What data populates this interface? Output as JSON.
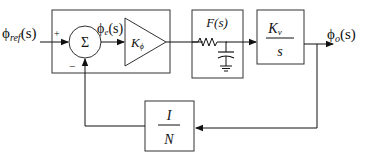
{
  "diagram": {
    "type": "PLL block diagram",
    "input_label": {
      "base": "ϕ",
      "sub": "ref",
      "arg": "(s)"
    },
    "output_label": {
      "base": "ϕ",
      "sub": "o",
      "arg": "(s)"
    },
    "error_label": {
      "base": "ϕ",
      "sub": "e",
      "arg": "(s)"
    },
    "summer": {
      "symbol": "Σ",
      "plus_sign": "+",
      "minus_sign": "−"
    },
    "phase_detector_gain": {
      "base": "K",
      "sub": "ϕ"
    },
    "loop_filter": {
      "title": "F(s)"
    },
    "vco": {
      "numerator_base": "K",
      "numerator_sub": "v",
      "denominator": "s"
    },
    "divider": {
      "numerator": "I",
      "denominator": "N"
    },
    "colors": {
      "stroke": "#333333",
      "background": "#ffffff"
    }
  }
}
